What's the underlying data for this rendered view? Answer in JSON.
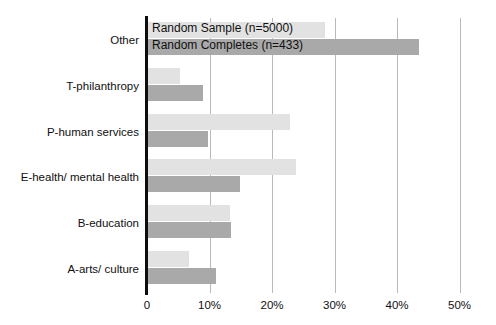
{
  "chart_data": {
    "type": "bar",
    "orientation": "horizontal",
    "title": "",
    "xlabel": "",
    "ylabel": "",
    "xlim": [
      0,
      50.4
    ],
    "xticks": [
      0,
      10,
      20,
      30,
      40,
      50
    ],
    "xtick_labels": [
      "0",
      "10%",
      "20%",
      "30%",
      "40%",
      "50%"
    ],
    "grid": "vertical",
    "legend_position": "top-left-inside",
    "categories": [
      "Other",
      "T-philanthropy",
      "P-human services",
      "E-health/ mental health",
      "B-education",
      "A-arts/ culture"
    ],
    "series": [
      {
        "name": "Random Sample (n=5000)",
        "color": "#e2e2e2",
        "values": [
          28.5,
          5.3,
          22.8,
          23.8,
          13.2,
          6.7
        ]
      },
      {
        "name": "Random Completes (n=433)",
        "color": "#a9a9a9",
        "values": [
          43.5,
          9.0,
          9.8,
          14.9,
          13.4,
          11.0
        ]
      }
    ]
  },
  "legend": {
    "entries": [
      "Random Sample (n=5000)",
      "Random Completes (n=433)"
    ]
  },
  "axis": {
    "color": "#0d0d0d",
    "gridline_color": "#b9b9b9"
  }
}
